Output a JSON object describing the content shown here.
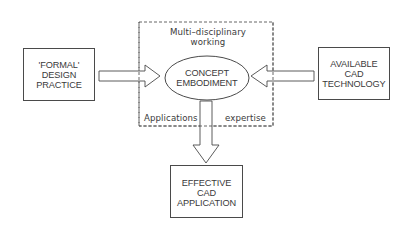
{
  "diagram": {
    "left_box": {
      "lines": [
        "'FORMAL'",
        "DESIGN",
        "PRACTICE"
      ]
    },
    "right_box": {
      "lines": [
        "AVAILABLE",
        "CAD",
        "TECHNOLOGY"
      ]
    },
    "bottom_box": {
      "lines": [
        "EFFECTIVE",
        "CAD",
        "APPLICATION"
      ]
    },
    "center_ellipse": {
      "lines": [
        "CONCEPT",
        "EMBODIMENT"
      ]
    },
    "dashed_region": {
      "top_label": [
        "Multi–disciplinary",
        "working"
      ],
      "bottom_left_label": "Applications",
      "bottom_right_label": "expertise"
    },
    "arrows": [
      {
        "from": "left_box",
        "to": "center_ellipse",
        "direction": "right"
      },
      {
        "from": "right_box",
        "to": "center_ellipse",
        "direction": "left"
      },
      {
        "from": "center_ellipse",
        "to": "bottom_box",
        "direction": "down"
      }
    ],
    "colors": {
      "stroke": "#4a4a4a",
      "text": "#3a3a3a",
      "background": "#ffffff"
    }
  }
}
